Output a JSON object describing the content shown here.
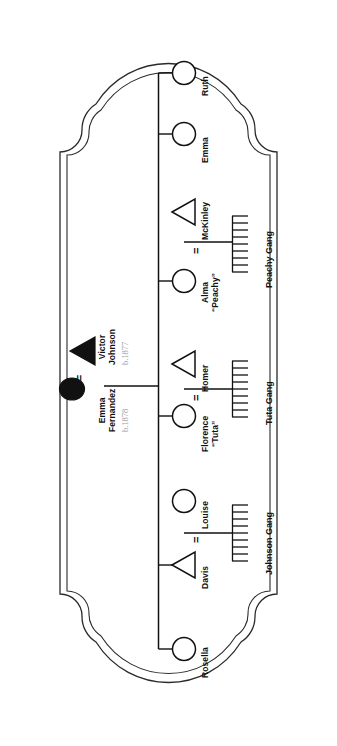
{
  "document": {
    "type": "genealogy-pedigree-chart",
    "orientation": "rotated-90-clockwise",
    "frame_style": "ornate-cartouche-double-border",
    "background_color": "#ffffff",
    "line_color": "#1a1a1a",
    "name_text_color": "#111111",
    "year_text_color": "#9b9b9b"
  },
  "legend": {
    "male_symbol": "triangle",
    "female_symbol": "circle",
    "filled_means": "proband-generation",
    "marriage_symbol": "=",
    "sibship_symbol": "comb"
  },
  "couple": {
    "label_equals": "=",
    "male": {
      "name_line1": "Victor",
      "name_line2": "Johnson",
      "birth": "b.1877",
      "symbol": "filled-triangle"
    },
    "female": {
      "name_line1": "Emma",
      "name_line2": "Fernandez",
      "birth": "b.1878",
      "symbol": "filled-circle"
    }
  },
  "children": [
    {
      "id": "ruth",
      "name": "Ruth",
      "symbol": "circle",
      "spouse": null,
      "sibship": null
    },
    {
      "id": "emma",
      "name": "Emma",
      "symbol": "circle",
      "spouse": null,
      "sibship": null
    },
    {
      "id": "alma",
      "name_line1": "Alma",
      "name_line2": "“Peachy”",
      "symbol": "circle",
      "equals": "=",
      "spouse": {
        "name": "McKinley",
        "symbol": "triangle"
      },
      "sibship": {
        "label": "Peachy Gang",
        "count": 9
      }
    },
    {
      "id": "florence",
      "name_line1": "Florence",
      "name_line2": "“Tuta”",
      "symbol": "circle",
      "equals": "=",
      "spouse": {
        "name": "Homer",
        "symbol": "triangle"
      },
      "sibship": {
        "label": "Tuta Gang",
        "count": 9
      }
    },
    {
      "id": "davis",
      "name": "Davis",
      "symbol": "triangle",
      "equals": "=",
      "spouse": {
        "name": "Louise",
        "symbol": "circle"
      },
      "sibship": {
        "label": "Johnson Gang",
        "count": 9
      }
    },
    {
      "id": "rosella",
      "name": "Rosella",
      "symbol": "circle",
      "spouse": null,
      "sibship": null
    }
  ]
}
